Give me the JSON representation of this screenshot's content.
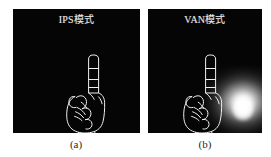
{
  "figure": {
    "caption_a": "(a)",
    "caption_b": "(b)",
    "background_color": "#ffffff",
    "panel_background_color": "#050505",
    "stroke_color": "#f0f0f0",
    "glow_color": "#ffffff"
  },
  "panels": [
    {
      "id": "ips",
      "title": "IPS模式",
      "caption": "(a)",
      "has_glow": false,
      "subject": "hand-pointing-up-line-drawing"
    },
    {
      "id": "van",
      "title": "VAN模式",
      "caption": "(b)",
      "has_glow": true,
      "subject": "hand-pointing-up-line-drawing"
    }
  ]
}
